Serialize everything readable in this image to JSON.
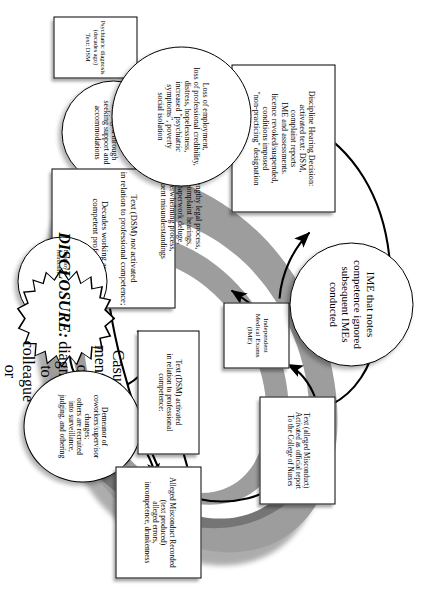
{
  "figure": {
    "college_label": "\"The College\"",
    "colors": {
      "arc_outer": "#9c9c9c",
      "arc_inner": "#8a8a8a",
      "arc_shadow": "#5a5a5a",
      "node_fill": "#ffffff",
      "line": "#000000"
    }
  },
  "nodes": {
    "psychiatric_diagnosis": {
      "shape": "box",
      "lines": [
        "Psychiatric diagnosis",
        "(decades ago)",
        "Text: DSM"
      ]
    },
    "pathologizable_symptoms": {
      "shape": "circle",
      "lines": [
        "Pathologizable",
        "\"symptoms\"",
        "managed through",
        "seeking support and",
        "accommodations"
      ]
    },
    "dsm_not_activated": {
      "shape": "box",
      "lines": [
        "Text (DSM) not activated",
        "in relation to professional competence;",
        "Decades working as a",
        "competent professional"
      ],
      "italic_word": "not"
    },
    "employment_insecurity": {
      "shape": "circle",
      "lines": [
        "Employment Insecurity:",
        "restructuring/amalgamation"
      ]
    },
    "disclosure": {
      "shape": "star",
      "lines": [
        "DISCLOSURE:",
        "Casual mention of",
        "diagnosis to colleague",
        "or supervisor"
      ]
    },
    "demeanor_change": {
      "shape": "ellipse",
      "lines": [
        "Demeanor of",
        "coworkers/supervisor",
        "changes;",
        "others are recruited",
        "into surveillance,",
        "judging, and othering"
      ]
    },
    "dsm_activated": {
      "shape": "box",
      "lines": [
        "Text (DSM) activated",
        "in relation to professional",
        "competence:"
      ]
    },
    "alleged_misconduct": {
      "shape": "box",
      "lines": [
        "Alleged Misconduct Recorded",
        "(text produced)",
        "alleged errors,",
        "incompetence, drunkenness"
      ]
    },
    "official_report": {
      "shape": "box",
      "lines": [
        "Text (alleged Misconduct)",
        "Activated as official report",
        "To the College of Nurses"
      ]
    },
    "ime_box": {
      "shape": "box",
      "lines": [
        "Independent",
        "Medical Exams",
        "(IME)"
      ]
    },
    "ime_ignored": {
      "shape": "circle",
      "lines": [
        "IME that notes",
        "competence ignored",
        "subsequent IMEs",
        "conducted"
      ]
    },
    "discipline_hearing": {
      "shape": "box",
      "lines": [
        "Discipline Hearing Decision:",
        "activated text: DSM,",
        "complaint reports",
        "IME and assessments.",
        "licence revoked/suspended,",
        "conditions imposed",
        "\"non-practicing\" designation"
      ]
    },
    "legal_process": {
      "shape": "circle",
      "lines": [
        "lengthy legal process,",
        "complaint hearings,",
        "paperwork deluge,",
        "overwhelming process,",
        "frequent misunderstandings"
      ]
    },
    "loss_of_employment": {
      "shape": "circle",
      "lines": [
        "Loss of employment,",
        "loss of professional credibility,",
        "distress, hopelessness,",
        "increased \"psychiatric",
        "symptoms\", poverty",
        "social isolation"
      ]
    }
  }
}
